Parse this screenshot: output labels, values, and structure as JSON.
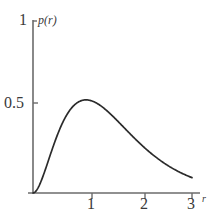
{
  "chart_data": {
    "type": "line",
    "title": "",
    "xlabel": "r",
    "ylabel": "p(r)",
    "xlim": [
      0,
      3.15
    ],
    "ylim": [
      0,
      1.0
    ],
    "grid": false,
    "legend": null,
    "series": [
      {
        "name": "p(r)",
        "formula": "4 r^2 e^(-2r)",
        "x": [
          0.0,
          0.1,
          0.2,
          0.3,
          0.4,
          0.5,
          0.6,
          0.7,
          0.8,
          0.9,
          1.0,
          1.1,
          1.2,
          1.3,
          1.4,
          1.5,
          1.6,
          1.7,
          1.8,
          1.9,
          2.0,
          2.1,
          2.2,
          2.3,
          2.4,
          2.5,
          2.6,
          2.7,
          2.8,
          2.9,
          3.0
        ],
        "y": [
          0.0,
          0.033,
          0.107,
          0.198,
          0.288,
          0.368,
          0.434,
          0.483,
          0.517,
          0.536,
          0.541,
          0.536,
          0.523,
          0.503,
          0.477,
          0.448,
          0.418,
          0.386,
          0.354,
          0.323,
          0.293,
          0.264,
          0.238,
          0.213,
          0.19,
          0.168,
          0.149,
          0.131,
          0.115,
          0.101,
          0.089
        ]
      }
    ],
    "peak": {
      "x": 1.0,
      "y": 0.541
    },
    "xticks": [
      {
        "value": 1,
        "label": "1"
      },
      {
        "value": 2,
        "label": "2"
      },
      {
        "value": 3,
        "label": "3"
      }
    ],
    "yticks": [
      {
        "value": 0.5,
        "label": "0.5"
      },
      {
        "value": 1.0,
        "label": "1"
      }
    ],
    "colors": {
      "curve": "#2b2b2b",
      "axis": "#6b6b6b",
      "text": "#3a3a3a",
      "background": "#ffffff"
    }
  },
  "labels": {
    "y_axis_name": "p(r)",
    "x_axis_name": "r",
    "y_tick_top": "1",
    "y_tick_half": "0.5",
    "x_tick_1": "1",
    "x_tick_2": "2",
    "x_tick_3": "3"
  }
}
